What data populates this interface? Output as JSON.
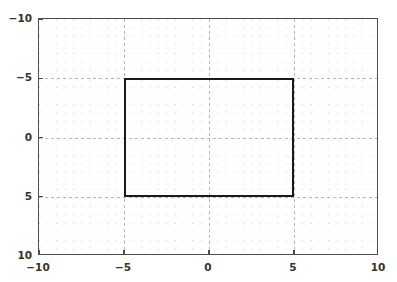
{
  "chart_data": {
    "type": "line",
    "title": "",
    "xlabel": "",
    "ylabel": "",
    "xlim": [
      -10,
      10
    ],
    "ylim": [
      -10,
      10
    ],
    "y_axis_inverted": true,
    "grid": true,
    "grid_minor_step": 0.5,
    "grid_major_step": 5,
    "legend": null,
    "xticks": [
      -10,
      -5,
      0,
      5,
      10
    ],
    "yticks": [
      -10,
      -5,
      0,
      5,
      10
    ],
    "xtick_labels": [
      "−10",
      "−5",
      "0",
      "5",
      "10"
    ],
    "ytick_labels": [
      "−10",
      "−5",
      "0",
      "5",
      "10"
    ],
    "series": [
      {
        "name": "rectangle",
        "shape": "rectangle",
        "closed": true,
        "color": "#1a1a1a",
        "linewidth": 2.2,
        "x": [
          -5,
          5,
          5,
          -5,
          -5
        ],
        "y": [
          -5,
          -5,
          5,
          5,
          -5
        ],
        "x_range": [
          -5,
          5
        ],
        "y_range": [
          -5,
          5
        ],
        "width": 10,
        "height": 10
      }
    ]
  },
  "axes": {
    "background_color": "#ffffff",
    "spine_color": "#4d4d4d",
    "minor_grid_color": "#cfcfcf",
    "major_grid_color": "#b6b6b6"
  },
  "figure": {
    "background_color": "#ffffff"
  }
}
